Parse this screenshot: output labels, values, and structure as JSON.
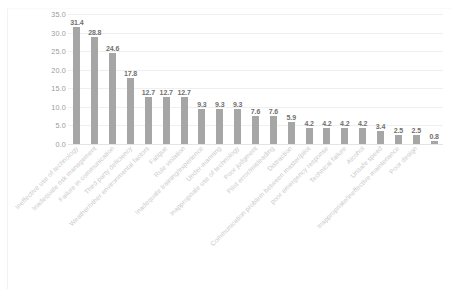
{
  "chart_data": {
    "type": "bar",
    "title": "",
    "subtitle": "",
    "xlabel": "",
    "ylabel": "",
    "ylim": [
      0.0,
      35.0
    ],
    "ytick_labels": [
      "35.0",
      "30.0",
      "25.0",
      "20.0",
      "15.0",
      "10.0",
      "5.0",
      "0.0"
    ],
    "ytick_values": [
      35.0,
      30.0,
      25.0,
      20.0,
      15.0,
      10.0,
      5.0,
      0.0
    ],
    "grid": true,
    "legend": false,
    "legend_position": "none",
    "bar_color": "#a6a6a6",
    "gridline_color": "#efefef",
    "label_color": "#c9c9c9",
    "value_label_color": "#6f6f6f",
    "categories": [
      "Ineffective use of technology",
      "Inadequate risk management",
      "Failure in communication",
      "Third party deficiency",
      "Weather/other environmental factors",
      "Fatigue",
      "Rule violation",
      "Inadequate training/experience",
      "Under-manning",
      "Inappropriate use of technology",
      "Poor judgment",
      "Pilot error/misleading",
      "Distraction",
      "Communication problem between master/pilot",
      "poor emergency response",
      "Technical failure",
      "Alcohol",
      "Unsafe speed",
      "Inappropriate/ineffective maintenance",
      "Poor design"
    ],
    "values": [
      31.4,
      28.8,
      24.6,
      17.8,
      12.7,
      12.7,
      12.7,
      9.3,
      9.3,
      9.3,
      7.6,
      7.6,
      5.9,
      4.2,
      4.2,
      4.2,
      4.2,
      3.4,
      2.5,
      2.5
    ],
    "value_labels": [
      "31.4",
      "28.8",
      "24.6",
      "17.8",
      "12.7",
      "12.7",
      "12.7",
      "9.3",
      "9.3",
      "9.3",
      "7.6",
      "7.6",
      "5.9",
      "4.2",
      "4.2",
      "4.2",
      "4.2",
      "3.4",
      "2.5",
      "2.5"
    ],
    "extra_point": {
      "label": "0.8",
      "value": 0.8,
      "category": "Poor design"
    }
  }
}
